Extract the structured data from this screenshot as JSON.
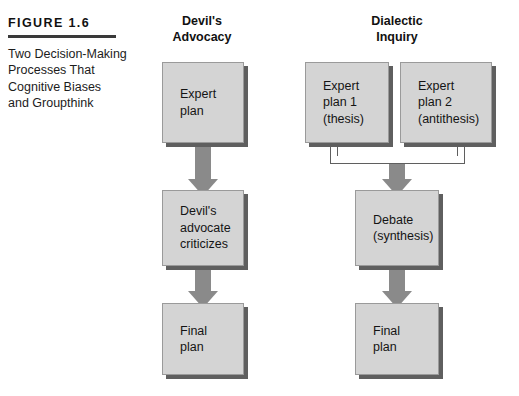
{
  "caption": {
    "figure_label": "FIGURE 1.6",
    "lines": [
      "Two Decision-Making",
      "Processes That",
      "Cognitive Biases",
      "and Groupthink"
    ]
  },
  "columns": {
    "devils_advocacy": {
      "heading_line1": "Devil's",
      "heading_line2": "Advocacy",
      "boxes": [
        {
          "lines": [
            "Expert",
            "plan"
          ]
        },
        {
          "lines": [
            "Devil's",
            "advocate",
            "criticizes"
          ]
        },
        {
          "lines": [
            "Final",
            "plan"
          ]
        }
      ]
    },
    "dialectic_inquiry": {
      "heading_line1": "Dialectic",
      "heading_line2": "Inquiry",
      "boxes": [
        {
          "lines": [
            "Expert",
            "plan 1",
            "(thesis)"
          ]
        },
        {
          "lines": [
            "Expert",
            "plan 2",
            "(antithesis)"
          ]
        },
        {
          "lines": [
            "Debate",
            "(synthesis)"
          ]
        },
        {
          "lines": [
            "Final",
            "plan"
          ]
        }
      ]
    }
  },
  "colors": {
    "box_fill": "#d4d4d4",
    "box_shadow": "#5f5f5f",
    "box_border": "#9a9a9a",
    "arrow": "#8a8a8a",
    "rule": "#3a3a3a",
    "text": "#141414",
    "background": "#ffffff"
  }
}
